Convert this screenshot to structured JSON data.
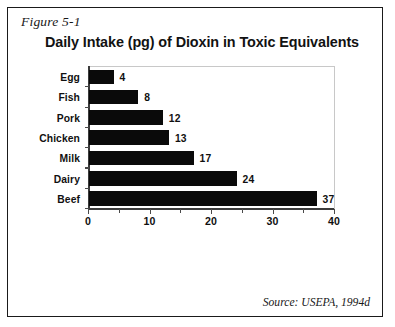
{
  "figure": {
    "caption": "Figure 5-1",
    "source_note": "Source: USEPA, 1994d",
    "frame_color": "#1a1a1a",
    "bar_color": "#0a0a0a"
  },
  "chart_data": {
    "type": "bar",
    "orientation": "horizontal",
    "title": "Daily Intake (pg) of Dioxin in Toxic Equivalents",
    "xlabel": "",
    "ylabel": "",
    "categories": [
      "Egg",
      "Fish",
      "Pork",
      "Chicken",
      "Milk",
      "Dairy",
      "Beef"
    ],
    "values": [
      4,
      8,
      12,
      13,
      17,
      24,
      37
    ],
    "value_labels": [
      "4",
      "8",
      "12",
      "13",
      "17",
      "24",
      "37"
    ],
    "xlim": [
      0,
      40
    ],
    "xticks": [
      0,
      10,
      20,
      30,
      40
    ],
    "xtick_labels": [
      "0",
      "10",
      "20",
      "30",
      "40"
    ],
    "minor_xticks": [
      5,
      15,
      25,
      35
    ],
    "grid": false,
    "legend": null,
    "units": "pg (picograms) Toxic Equivalents per day",
    "series": [
      {
        "name": "Daily Intake (pg)",
        "values": [
          4,
          8,
          12,
          13,
          17,
          24,
          37
        ]
      }
    ]
  }
}
